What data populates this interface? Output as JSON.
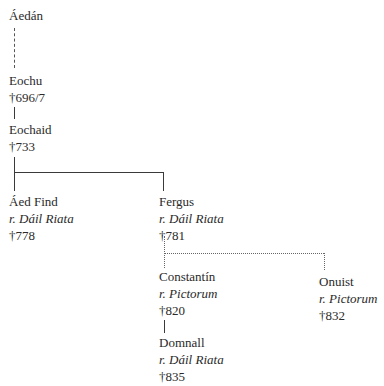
{
  "diagram": {
    "type": "genealogy",
    "people": [
      {
        "id": "aedan",
        "name": "Áedán",
        "title": null,
        "death": null
      },
      {
        "id": "eochu",
        "name": "Eochu",
        "title": null,
        "death": "†696/7"
      },
      {
        "id": "eochaid",
        "name": "Eochaid",
        "title": null,
        "death": "†733"
      },
      {
        "id": "aed-find",
        "name": "Áed Find",
        "title": "r. Dáil Riata",
        "death": "†778"
      },
      {
        "id": "fergus",
        "name": "Fergus",
        "title": "r. Dáil Riata",
        "death": "†781"
      },
      {
        "id": "constantin",
        "name": "Constantín",
        "title": "r. Pictorum",
        "death": "†820"
      },
      {
        "id": "onuist",
        "name": "Onuist",
        "title": "r. Pictorum",
        "death": "†832"
      },
      {
        "id": "domnall",
        "name": "Domnall",
        "title": "r. Dáil Riata",
        "death": "†835"
      }
    ],
    "links": [
      {
        "from": "aedan",
        "to": "eochu",
        "style": "dashed"
      },
      {
        "from": "eochu",
        "to": "eochaid",
        "style": "solid"
      },
      {
        "from": "eochaid",
        "to": "aed-find",
        "style": "solid"
      },
      {
        "from": "eochaid",
        "to": "fergus",
        "style": "solid"
      },
      {
        "from": "fergus",
        "to": "constantin",
        "style": "dotted"
      },
      {
        "from": "fergus",
        "to": "onuist",
        "style": "dotted"
      },
      {
        "from": "constantin",
        "to": "domnall",
        "style": "solid"
      }
    ]
  }
}
